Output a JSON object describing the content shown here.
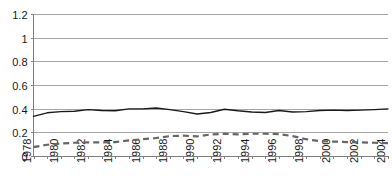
{
  "chart_data": {
    "type": "line",
    "title": "",
    "subtitle": "",
    "xlabel": "",
    "ylabel": "",
    "ylim": [
      0,
      1.2
    ],
    "ytick_values": [
      0,
      0.2,
      0.4,
      0.6,
      0.8,
      1,
      1.2
    ],
    "ytick_labels": [
      "0",
      "0.2",
      "0.4",
      "0.6",
      "0.8",
      "1",
      "1.2"
    ],
    "grid": true,
    "grid_axis": "y",
    "legend": "none",
    "x": [
      1978,
      1979,
      1980,
      1981,
      1982,
      1983,
      1984,
      1985,
      1986,
      1987,
      1988,
      1989,
      1990,
      1991,
      1992,
      1993,
      1994,
      1995,
      1996,
      1997,
      1998,
      1999,
      2000,
      2001,
      2002,
      2003,
      2004
    ],
    "xtick_labels": [
      "1978",
      "",
      "1980",
      "",
      "1982",
      "",
      "1984",
      "",
      "1986",
      "",
      "1988",
      "",
      "1990",
      "",
      "1992",
      "",
      "1994",
      "",
      "1996",
      "",
      "1998",
      "",
      "2000",
      "",
      "2002",
      "",
      "2004"
    ],
    "xtick_labels_shown": [
      "1978",
      "1980",
      "1982",
      "1984",
      "1986",
      "1988",
      "1990",
      "1992",
      "1994",
      "1996",
      "1998",
      "2000",
      "2002",
      "2004"
    ],
    "series": [
      {
        "name": "solid-series",
        "style": "solid",
        "color": "#1a1a1a",
        "values": [
          0.335,
          0.365,
          0.375,
          0.378,
          0.392,
          0.385,
          0.382,
          0.398,
          0.398,
          0.405,
          0.392,
          0.375,
          0.355,
          0.368,
          0.395,
          0.382,
          0.372,
          0.368,
          0.385,
          0.372,
          0.375,
          0.385,
          0.388,
          0.385,
          0.388,
          0.392,
          0.398
        ]
      },
      {
        "name": "dashed-series",
        "style": "dashed",
        "color": "#666666",
        "values": [
          0.075,
          0.095,
          0.105,
          0.112,
          0.115,
          0.115,
          0.118,
          0.132,
          0.142,
          0.152,
          0.168,
          0.172,
          0.165,
          0.182,
          0.188,
          0.182,
          0.188,
          0.188,
          0.185,
          0.168,
          0.142,
          0.125,
          0.122,
          0.118,
          0.115,
          0.112,
          0.108
        ]
      }
    ]
  }
}
